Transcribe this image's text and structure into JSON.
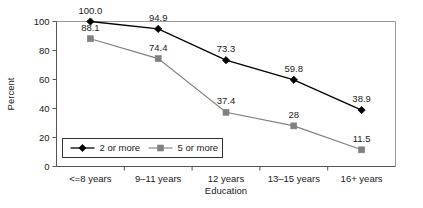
{
  "chart_data": {
    "type": "line",
    "title": "",
    "xlabel": "Education",
    "ylabel": "Percent",
    "categories": [
      "<=8 years",
      "9–11 years",
      "12 years",
      "13–15 years",
      "16+ years"
    ],
    "ylim": [
      0,
      100
    ],
    "ytick_values": [
      0,
      20,
      40,
      60,
      80,
      100
    ],
    "yticks": [
      "0",
      "20",
      "40",
      "60",
      "80",
      "100"
    ],
    "grid": false,
    "legend_position": "lower-left-inside",
    "series": [
      {
        "name": "2 or more",
        "color": "#000000",
        "marker": "diamond",
        "values": [
          100.0,
          94.9,
          73.3,
          59.8,
          38.9
        ],
        "labels": [
          "100.0",
          "94.9",
          "73.3",
          "59.8",
          "38.9"
        ]
      },
      {
        "name": "5 or more",
        "color": "#808080",
        "marker": "square",
        "values": [
          88.1,
          74.4,
          37.4,
          28.0,
          11.5
        ],
        "labels": [
          "88.1",
          "74.4",
          "37.4",
          "28",
          "11.5"
        ]
      }
    ]
  },
  "axis": {
    "y_title": "Percent",
    "x_title": "Education",
    "frame_color": "#999999",
    "axis_color": "#555555"
  },
  "legend": {
    "entries": [
      {
        "label": "2 or more",
        "color": "#000000",
        "marker": "diamond"
      },
      {
        "label": "5 or more",
        "color": "#808080",
        "marker": "square"
      }
    ]
  }
}
